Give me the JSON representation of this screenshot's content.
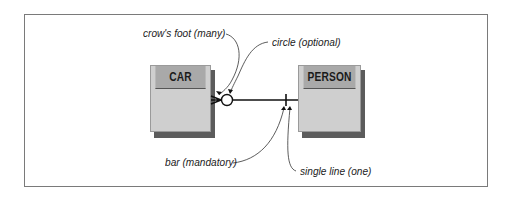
{
  "diagram": {
    "type": "entity-relationship",
    "entities": [
      {
        "id": "car",
        "name": "CAR"
      },
      {
        "id": "person",
        "name": "PERSON"
      }
    ],
    "relationship": {
      "from": "CAR",
      "to": "PERSON",
      "car_end": [
        "crow's foot (many)",
        "circle (optional)"
      ],
      "person_end": [
        "bar (mandatory)",
        "single line (one)"
      ]
    },
    "annotations": {
      "crows_foot": "crow's foot (many)",
      "circle": "circle (optional)",
      "bar": "bar (mandatory)",
      "single_line": "single line (one)"
    },
    "colors": {
      "entity_header": "#a9a9a9",
      "entity_body": "#cfcfcf",
      "entity_shadow": "#5c5c5c",
      "frame": "#7a7a7a",
      "line": "#111111"
    }
  }
}
